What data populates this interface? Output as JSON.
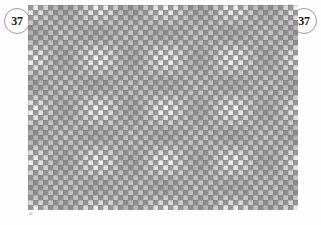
{
  "page": {
    "background_color": "#fdfdfd",
    "width": 321,
    "height": 225
  },
  "badges": {
    "left": {
      "label": "37",
      "name": "page-number-badge-left",
      "border_color": "#9a9a9a",
      "text_color": "#1a1a1a"
    },
    "right": {
      "label": "37",
      "name": "page-number-badge-right",
      "border_color": "#9a9a9a",
      "text_color": "#1a1a1a"
    }
  },
  "corner_marks": {
    "top_right": "40",
    "bottom_left": "40"
  },
  "figure": {
    "plate": {
      "x": 28,
      "y": 5,
      "width": 270,
      "height": 205,
      "base_color": "#8a8a8a",
      "mid_color": "#b4b4b4",
      "bright_color": "#ededed"
    }
  },
  "chart_data": {
    "type": "heatmap",
    "xlabel": "",
    "ylabel": "",
    "grid": true,
    "legend": "none",
    "cell_size_px": 5,
    "cols": 54,
    "rows": 41,
    "value_range": [
      0,
      1
    ],
    "colormap": {
      "low": "#7e7e7e",
      "mid": "#b4b4b4",
      "high": "#f2f2f2"
    },
    "generator": {
      "description": "Checkerboard tile brightness modulated by product of two cosine interference envelopes, producing lens/diamond shaped bright lobes.",
      "period_x": 13.5,
      "period_y": 10.25,
      "checker_parity_weight": 0.55,
      "envelope_weight": 0.45
    },
    "annotations": []
  }
}
